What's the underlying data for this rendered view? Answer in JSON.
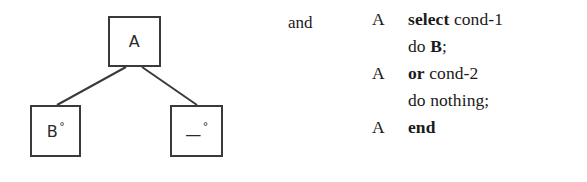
{
  "figure": {
    "conjunction": "and",
    "tree": {
      "root": {
        "label": "A"
      },
      "children": [
        {
          "label": "B",
          "marker": "°"
        },
        {
          "label": "—",
          "marker": "°"
        }
      ]
    },
    "listing": [
      {
        "gutter": "A",
        "tokens": [
          {
            "text": "select",
            "bold": true
          },
          {
            "text": " cond-1",
            "bold": false
          }
        ]
      },
      {
        "gutter": "",
        "tokens": [
          {
            "text": "do ",
            "bold": false
          },
          {
            "text": "B",
            "bold": true
          },
          {
            "text": ";",
            "bold": false
          }
        ]
      },
      {
        "gutter": "A",
        "tokens": [
          {
            "text": "or",
            "bold": true
          },
          {
            "text": " cond-2",
            "bold": false
          }
        ]
      },
      {
        "gutter": "",
        "tokens": [
          {
            "text": "do nothing;",
            "bold": false
          }
        ]
      },
      {
        "gutter": "A",
        "tokens": [
          {
            "text": "end",
            "bold": true
          }
        ]
      }
    ]
  },
  "colors": {
    "ink": "#1a1a1a",
    "stroke": "#3a3a3a",
    "paper": "#ffffff"
  }
}
